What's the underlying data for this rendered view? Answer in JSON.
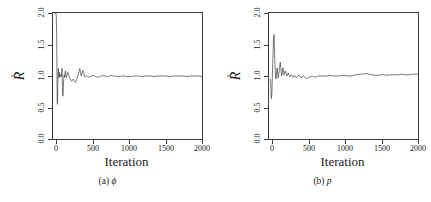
{
  "figure": {
    "name": "gelman-rubin-diagnostic-figure",
    "background_color": "#ffffff",
    "line_color": "#3c3c3c",
    "axis_color": "#3c3c3c",
    "panel_count": 2
  },
  "panels": [
    {
      "id": "a",
      "caption_id": "(a)",
      "caption_symbol": "ϕ",
      "ylabel_base": "R",
      "ylabel_accent": "^",
      "xlabel": "Iteration",
      "xticks": [
        "0",
        "500",
        "1000",
        "1500",
        "2000"
      ],
      "yticks": [
        "0.0",
        "0.5",
        "1.0",
        "1.5",
        "2.0"
      ]
    },
    {
      "id": "b",
      "caption_id": "(b)",
      "caption_symbol": "p",
      "ylabel_base": "R",
      "ylabel_accent": "^",
      "xlabel": "Iteration",
      "xticks": [
        "0",
        "500",
        "1000",
        "1500",
        "2000"
      ],
      "yticks": [
        "0.0",
        "0.5",
        "1.0",
        "1.5",
        "2.0"
      ]
    }
  ],
  "chart_data": [
    {
      "type": "line",
      "title": "(a) ϕ",
      "xlabel": "Iteration",
      "ylabel": "R-hat",
      "xlim": [
        0,
        2000
      ],
      "ylim": [
        0.0,
        2.0
      ],
      "xticks": [
        0,
        500,
        1000,
        1500,
        2000
      ],
      "yticks": [
        0.0,
        0.5,
        1.0,
        1.5,
        2.0
      ],
      "grid": false,
      "legend": "none",
      "series": [
        {
          "name": "R-hat phi",
          "x": [
            20,
            26,
            32,
            38,
            44,
            50,
            56,
            60,
            64,
            68,
            72,
            76,
            80,
            84,
            88,
            92,
            96,
            100,
            104,
            108,
            112,
            116,
            120,
            126,
            132,
            138,
            144,
            150,
            156,
            162,
            168,
            174,
            180,
            186,
            192,
            200,
            210,
            220,
            230,
            240,
            250,
            260,
            270,
            280,
            290,
            300,
            310,
            320,
            330,
            340,
            350,
            360,
            370,
            380,
            390,
            400,
            410,
            420,
            430,
            440,
            450,
            460,
            470,
            480,
            500,
            520,
            540,
            560,
            580,
            600,
            620,
            640,
            660,
            680,
            700,
            720,
            740,
            760,
            780,
            800,
            840,
            880,
            920,
            960,
            1000,
            1040,
            1080,
            1120,
            1160,
            1200,
            1240,
            1280,
            1320,
            1360,
            1400,
            1440,
            1480,
            1520,
            1560,
            1600,
            1640,
            1680,
            1720,
            1760,
            1800,
            1840,
            1880,
            1920,
            1960,
            2000
          ],
          "y": [
            2.0,
            2.0,
            2.0,
            2.0,
            1.95,
            1.6,
            0.62,
            0.55,
            0.86,
            1.02,
            1.12,
            1.05,
            0.97,
            1.04,
            1.06,
            0.99,
            1.0,
            1.02,
            1.0,
            1.01,
            0.99,
            1.02,
            1.12,
            0.85,
            0.68,
            0.82,
            0.95,
            1.02,
            0.98,
            1.05,
            1.08,
            1.0,
            0.97,
            1.01,
            1.04,
            1.06,
            1.02,
            0.98,
            0.95,
            0.93,
            0.92,
            0.93,
            0.95,
            0.93,
            0.91,
            0.9,
            0.92,
            0.95,
            0.99,
            1.03,
            1.07,
            1.12,
            1.05,
            1.0,
            1.04,
            1.09,
            1.06,
            1.0,
            0.98,
            0.99,
            1.0,
            1.0,
            0.99,
            0.98,
            0.99,
            1.0,
            1.01,
            1.0,
            0.99,
            0.98,
            0.99,
            1.0,
            1.0,
            1.01,
            1.0,
            0.99,
            0.99,
            1.0,
            1.01,
            1.0,
            1.0,
            0.99,
            1.0,
            1.0,
            0.99,
            0.99,
            1.0,
            1.0,
            1.0,
            0.99,
            1.0,
            1.0,
            1.0,
            0.99,
            1.0,
            1.0,
            1.0,
            1.0,
            0.99,
            1.0,
            1.0,
            1.0,
            1.0,
            1.0,
            0.99,
            1.0,
            1.0,
            1.0,
            1.0,
            0.99,
            0.99
          ]
        }
      ]
    },
    {
      "type": "line",
      "title": "(b) p",
      "xlabel": "Iteration",
      "ylabel": "R-hat",
      "xlim": [
        0,
        2000
      ],
      "ylim": [
        0.0,
        2.0
      ],
      "xticks": [
        0,
        500,
        1000,
        1500,
        2000
      ],
      "yticks": [
        0.0,
        0.5,
        1.0,
        1.5,
        2.0
      ],
      "grid": false,
      "legend": "none",
      "series": [
        {
          "name": "R-hat p",
          "x": [
            20,
            26,
            32,
            38,
            44,
            50,
            56,
            62,
            68,
            74,
            80,
            86,
            92,
            98,
            104,
            110,
            116,
            122,
            128,
            134,
            140,
            146,
            152,
            158,
            164,
            170,
            176,
            182,
            188,
            194,
            200,
            210,
            220,
            230,
            240,
            250,
            260,
            270,
            280,
            290,
            300,
            310,
            320,
            330,
            340,
            350,
            360,
            370,
            380,
            390,
            400,
            410,
            420,
            430,
            440,
            450,
            460,
            470,
            480,
            490,
            500,
            520,
            540,
            560,
            580,
            600,
            620,
            640,
            660,
            680,
            700,
            740,
            780,
            820,
            860,
            900,
            940,
            980,
            1020,
            1060,
            1100,
            1140,
            1180,
            1220,
            1260,
            1300,
            1340,
            1380,
            1420,
            1460,
            1500,
            1540,
            1580,
            1620,
            1660,
            1700,
            1740,
            1780,
            1820,
            1860,
            1900,
            1940,
            1980,
            2000
          ],
          "y": [
            0.95,
            0.78,
            0.64,
            0.72,
            0.95,
            1.2,
            1.42,
            1.62,
            1.66,
            1.4,
            1.18,
            1.02,
            0.95,
            1.0,
            1.08,
            1.13,
            1.05,
            0.97,
            1.0,
            1.06,
            1.1,
            1.17,
            1.22,
            1.14,
            1.06,
            1.0,
            1.04,
            1.1,
            1.13,
            1.08,
            1.02,
            1.05,
            1.08,
            1.04,
            1.0,
            1.02,
            1.05,
            1.02,
            0.99,
            1.0,
            1.02,
            1.0,
            0.98,
            0.99,
            1.01,
            1.0,
            0.98,
            0.97,
            0.99,
            1.0,
            1.02,
            1.0,
            0.98,
            0.97,
            0.98,
            1.0,
            1.0,
            0.99,
            0.98,
            0.97,
            0.96,
            0.97,
            0.98,
            0.99,
            1.0,
            0.99,
            0.98,
            0.99,
            1.0,
            1.0,
            1.0,
            1.0,
            1.0,
            1.01,
            1.0,
            1.0,
            1.0,
            1.01,
            1.01,
            1.0,
            1.0,
            1.01,
            1.02,
            1.03,
            1.03,
            1.04,
            1.03,
            1.02,
            1.01,
            1.01,
            1.02,
            1.02,
            1.01,
            1.02,
            1.02,
            1.02,
            1.02,
            1.03,
            1.02,
            1.02,
            1.02,
            1.03,
            1.03,
            1.03,
            1.03
          ]
        }
      ]
    }
  ]
}
